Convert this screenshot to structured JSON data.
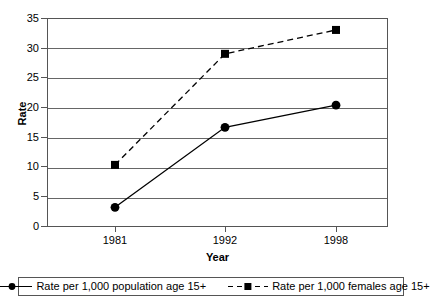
{
  "chart_data": {
    "type": "line",
    "title": "",
    "xlabel": "Year",
    "ylabel": "Rate",
    "categories": [
      "1981",
      "1992",
      "1998"
    ],
    "x": [
      1981,
      1992,
      1998
    ],
    "ylim": [
      0,
      35
    ],
    "yticks": [
      0,
      5,
      10,
      15,
      20,
      25,
      30,
      35
    ],
    "ytick_labels": [
      "0",
      "5",
      "10",
      "15",
      "20",
      "25",
      "30",
      "35"
    ],
    "grid": true,
    "legend_position": "bottom",
    "series": [
      {
        "name": "Rate per 1,000 population age 15+",
        "values": [
          3.3,
          16.7,
          20.4
        ],
        "marker": "circle",
        "line_style": "solid",
        "color": "#000000"
      },
      {
        "name": "Rate per 1,000 females age 15+",
        "values": [
          10.4,
          29.0,
          33.0
        ],
        "marker": "square",
        "line_style": "dashed",
        "color": "#000000"
      }
    ]
  },
  "axes": {
    "y_title": "Rate",
    "x_title": "Year"
  },
  "legend": {
    "entries": [
      {
        "label": "Rate per 1,000 population age 15+",
        "marker": "circle-marker-icon",
        "style": "solid"
      },
      {
        "label": "Rate per 1,000 females age 15+",
        "marker": "square-marker-icon",
        "style": "dashed"
      }
    ]
  },
  "colors": {
    "line": "#000000",
    "grid": "#666666",
    "frame": "#555555",
    "background": "#ffffff"
  }
}
